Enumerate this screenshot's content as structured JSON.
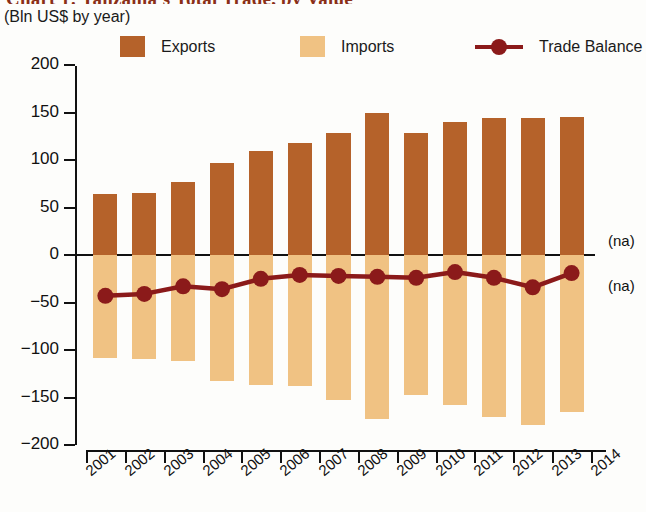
{
  "header": {
    "title": "Chart 1: Tanzania's Total Trade, by Value",
    "subtitle": "(Bln US$ by year)"
  },
  "legend": {
    "items": [
      {
        "label": "Exports",
        "type": "swatch",
        "color": "#B5622A"
      },
      {
        "label": "Imports",
        "type": "swatch",
        "color": "#F0C283"
      },
      {
        "label": "Trade Balance",
        "type": "line-marker",
        "color": "#8B1A1A"
      }
    ]
  },
  "annotations": {
    "na_upper": "(na)",
    "na_lower": "(na)"
  },
  "chart_data": {
    "type": "bar",
    "title": "Chart 1: Tanzania's Total Trade, by Value",
    "subtitle": "(Bln US$ by year)",
    "xlabel": "",
    "ylabel": "(Bln US$ by year)",
    "ylim": [
      -200,
      200
    ],
    "yticks": [
      200,
      150,
      100,
      50,
      0,
      -50,
      -100,
      -150,
      -200
    ],
    "ytick_labels": [
      "200",
      "150",
      "100",
      "50",
      "0",
      "−500",
      "−100",
      "−150",
      "−200"
    ],
    "xticks": [
      "2001",
      "2002",
      "2003",
      "2004",
      "2005",
      "2006",
      "2007",
      "2008",
      "2009",
      "2010",
      "2011",
      "2012",
      "2013",
      "2014"
    ],
    "categories": [
      "2001",
      "2002",
      "2003",
      "2004",
      "2005",
      "2006",
      "2007",
      "2008",
      "2009",
      "2010",
      "2011",
      "2012",
      "2013"
    ],
    "grid": false,
    "legend_position": "top",
    "series": [
      {
        "name": "Exports",
        "type": "bar",
        "color": "#B5622A",
        "values": [
          64,
          65,
          77,
          97,
          109,
          118,
          128,
          149,
          128,
          140,
          144,
          144,
          145
        ]
      },
      {
        "name": "Imports",
        "type": "bar",
        "color": "#F0C283",
        "values": [
          -108,
          -109,
          -112,
          -133,
          -137,
          -138,
          -153,
          -173,
          -147,
          -158,
          -170,
          -179,
          -165
        ]
      },
      {
        "name": "Trade Balance",
        "type": "line",
        "color": "#8B1A1A",
        "values": [
          -43,
          -41,
          -33,
          -36,
          -25,
          -21,
          -22,
          -23,
          -24,
          -18,
          -24,
          -34,
          -19
        ]
      }
    ],
    "notes": [
      "(na)",
      "(na)"
    ]
  }
}
